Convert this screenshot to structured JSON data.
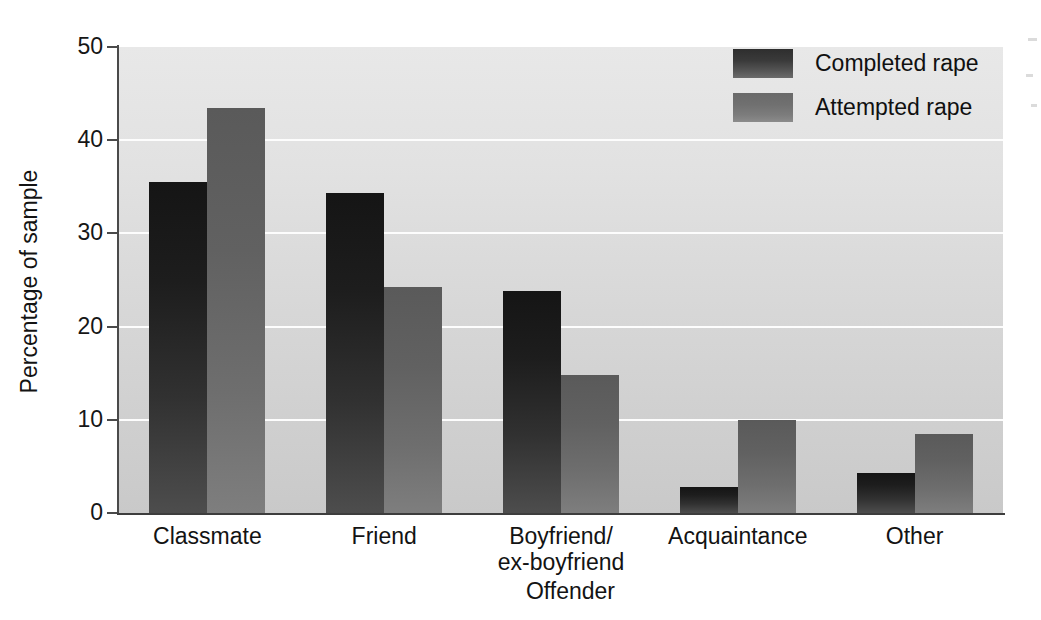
{
  "chart_data": {
    "type": "bar",
    "title": "",
    "xlabel": "Offender",
    "ylabel": "Percentage of sample",
    "categories": [
      "Classmate",
      "Friend",
      "Boyfriend/\nex-boyfriend",
      "Acquaintance",
      "Other"
    ],
    "category_lines": [
      [
        "Classmate"
      ],
      [
        "Friend"
      ],
      [
        "Boyfriend/",
        "ex-boyfriend"
      ],
      [
        "Acquaintance"
      ],
      [
        "Other"
      ]
    ],
    "series": [
      {
        "name": "Completed rape",
        "values": [
          35.5,
          34.3,
          23.8,
          2.8,
          4.3
        ],
        "color": "#1d1d1d"
      },
      {
        "name": "Attempted rape",
        "values": [
          43.5,
          24.3,
          14.8,
          10.0,
          8.5
        ],
        "color": "#6e6e6e"
      }
    ],
    "ylim": [
      0,
      50
    ],
    "yticks": [
      0,
      10,
      20,
      30,
      40,
      50
    ],
    "ytick_labels": [
      "0",
      "10",
      "20",
      "30",
      "40",
      "50"
    ],
    "grid": "horizontal-white",
    "legend_position": "top-right",
    "plot_background": "#dcdcdc"
  },
  "legend": {
    "items": [
      {
        "label": "Completed rape",
        "swatch": "completed"
      },
      {
        "label": "Attempted rape",
        "swatch": "attempted"
      }
    ]
  },
  "axes": {
    "y_title": "Percentage of sample",
    "x_title": "Offender"
  }
}
